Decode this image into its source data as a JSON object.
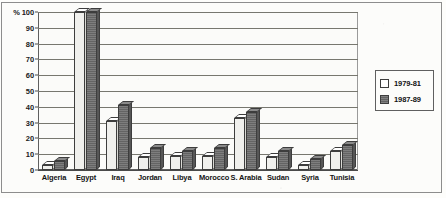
{
  "chart_data": {
    "type": "bar",
    "title": "",
    "xlabel": "",
    "ylabel": "%",
    "ylim": [
      0,
      100
    ],
    "yticks": [
      0,
      10,
      20,
      30,
      40,
      50,
      60,
      70,
      80,
      90,
      100
    ],
    "ytick_labels": [
      "0",
      "10",
      "20",
      "30",
      "40",
      "50",
      "60",
      "70",
      "80",
      "90",
      "% 100"
    ],
    "grid": true,
    "legend_position": "right",
    "categories": [
      "Algeria",
      "Egypt",
      "Iraq",
      "Jordan",
      "Libya",
      "Morocco",
      "S. Arabia",
      "Sudan",
      "Syria",
      "Tunisia"
    ],
    "series": [
      {
        "name": "1979-81",
        "color": "#f0f0ed",
        "values": [
          3,
          100,
          31,
          8,
          9,
          9,
          33,
          8,
          3,
          12
        ]
      },
      {
        "name": "1987-89",
        "color": "#6f6f6f",
        "values": [
          6,
          100,
          41,
          14,
          12,
          14,
          37,
          12,
          7,
          16
        ]
      }
    ]
  },
  "axis": {
    "y_unit_symbol": "%"
  },
  "legend": {
    "entries": [
      {
        "label": "1979-81",
        "swatch": "light-swatch"
      },
      {
        "label": "1987-89",
        "swatch": "dark-swatch"
      }
    ]
  }
}
